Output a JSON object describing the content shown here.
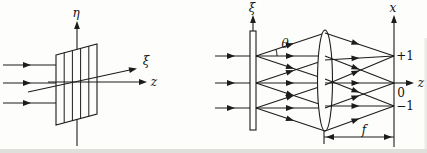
{
  "colors": {
    "ink": "#1c1c1c",
    "paper": "#fdfdfb"
  },
  "left_panel": {
    "description": "plane waves incident on a diffraction grating",
    "eta_axis_label": "η",
    "xi_axis_label": "ξ",
    "z_axis_label": "z"
  },
  "right_panel": {
    "description": "grating with lens focusing diffraction orders in focal plane",
    "xi_axis_label": "ξ",
    "x_axis_label": "x",
    "z_axis_label": "z",
    "theta_angle_label": "θ",
    "order_plus_one": "+1",
    "order_zero": "0",
    "order_minus_one": "−1",
    "focal_length_label": "f"
  }
}
